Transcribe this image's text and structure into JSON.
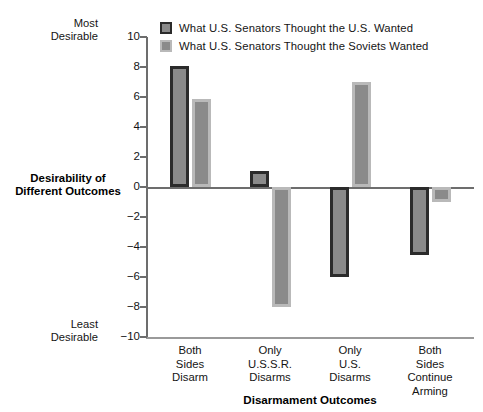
{
  "chart_data": {
    "type": "bar",
    "title": "",
    "xlabel": "Disarmament Outcomes",
    "ylabel": "Desirability of Different Outcomes",
    "ylim": [
      -10,
      10
    ],
    "ytick_step": 2,
    "yticks": [
      "10",
      "8",
      "6",
      "4",
      "2",
      "0",
      "-2",
      "-4",
      "-6",
      "-8",
      "-10"
    ],
    "grid": false,
    "legend_position": "top-left",
    "axis_anchor_high": "Most Desirable",
    "axis_anchor_low": "Least Desirable",
    "categories": [
      "Both Sides Disarm",
      "Only U.S.S.R. Disarms",
      "Only U.S. Disarms",
      "Both Sides Continue Arming"
    ],
    "category_lines": [
      [
        "Both",
        "Sides",
        "Disarm"
      ],
      [
        "Only",
        "U.S.S.R.",
        "Disarms"
      ],
      [
        "Only",
        "U.S.",
        "Disarms"
      ],
      [
        "Both",
        "Sides",
        "Continue",
        "Arming"
      ]
    ],
    "series": [
      {
        "name": "What U.S. Senators Thought the U.S. Wanted",
        "color": "#8a8a8a",
        "edge_color": "#2b2b2b",
        "values": [
          8.1,
          1.1,
          -6.0,
          -4.5
        ]
      },
      {
        "name": "What U.S. Senators Thought the Soviets Wanted",
        "color": "#8a8a8a",
        "edge_color": "#b9b9b9",
        "values": [
          5.9,
          -8.0,
          7.0,
          -1.0
        ]
      }
    ]
  },
  "axis_titles": {
    "y_line1": "Desirability of",
    "y_line2": "Different Outcomes",
    "x": "Disarmament Outcomes"
  },
  "anchors": {
    "most_line1": "Most",
    "most_line2": "Desirable",
    "least_line1": "Least",
    "least_line2": "Desirable"
  }
}
